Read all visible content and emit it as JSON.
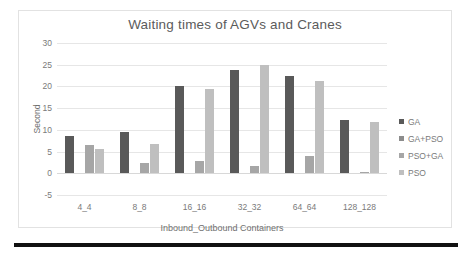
{
  "chart_data": {
    "type": "bar",
    "title": "Waiting times of AGVs and Cranes",
    "xlabel": "Inbound_Outbound Containers",
    "ylabel": "Second",
    "categories": [
      "4_4",
      "8_8",
      "16_16",
      "32_32",
      "64_64",
      "128_128"
    ],
    "series": [
      {
        "name": "GA",
        "color": "#595959",
        "values": [
          8.5,
          9.4,
          20.2,
          23.9,
          22.4,
          12.2
        ]
      },
      {
        "name": "GA+PSO",
        "color": "#8c8c8c",
        "values": [
          0,
          0,
          0,
          0,
          0,
          0
        ]
      },
      {
        "name": "PSO+GA",
        "color": "#a6a6a6",
        "values": [
          6.6,
          2.3,
          2.8,
          1.6,
          4.0,
          0.3
        ]
      },
      {
        "name": "PSO",
        "color": "#bfbfbf",
        "values": [
          5.6,
          6.7,
          19.4,
          25.0,
          21.3,
          11.8
        ]
      }
    ],
    "ylim": [
      -5,
      30
    ],
    "yticks": [
      30,
      25,
      20,
      15,
      10,
      5,
      0,
      -5
    ],
    "grid": true,
    "legend_position": "right"
  }
}
